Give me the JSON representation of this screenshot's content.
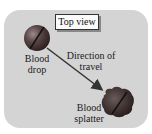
{
  "diagram": {
    "view_label": "Top view",
    "drop_label_line1": "Blood",
    "drop_label_line2": "drop",
    "direction_label_line1": "Direction of",
    "direction_label_line2": "travel",
    "splatter_label_line1": "Blood",
    "splatter_label_line2": "splatter"
  },
  "colors": {
    "panel": "#d4d4d4",
    "drop_dark": "#3a2a2a",
    "drop_mid": "#7a5a5a",
    "arrow": "#333333"
  }
}
